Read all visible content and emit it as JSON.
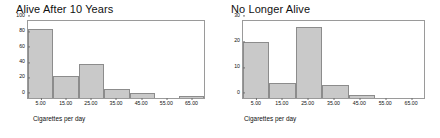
{
  "chart_data": [
    {
      "type": "bar",
      "title": "Alive After 10 Years",
      "xlabel": "Cigarettes per day",
      "ylabel": "",
      "categories": [
        "5.00",
        "15.00",
        "25.00",
        "35.00",
        "45.00",
        "55.00",
        "65.00"
      ],
      "values": [
        90,
        28,
        44,
        12,
        7,
        0,
        2
      ],
      "xlim": [
        0,
        70
      ],
      "ylim": [
        0,
        100
      ],
      "yticks": [
        "0",
        "20",
        "40",
        "60",
        "80",
        "100"
      ],
      "ytick_values": [
        0,
        20,
        40,
        60,
        80,
        100
      ],
      "xticks": [
        "5.00",
        "15.00",
        "25.00",
        "35.00",
        "45.00",
        "55.00",
        "65.00"
      ],
      "grid": false,
      "legend": "none",
      "bar_fill": "#c9c9c9",
      "bar_edge": "#8c8c8c"
    },
    {
      "type": "bar",
      "title": "No Longer Alive",
      "xlabel": "Cigarettes per day",
      "ylabel": "",
      "categories": [
        "5.00",
        "15.00",
        "25.00",
        "35.00",
        "45.00",
        "55.00",
        "65.00"
      ],
      "values": [
        22,
        6,
        27.5,
        5,
        1,
        0,
        0
      ],
      "xlim": [
        0,
        70
      ],
      "ylim": [
        0,
        30
      ],
      "yticks": [
        "0",
        "10",
        "20",
        "30"
      ],
      "ytick_values": [
        0,
        10,
        20,
        30
      ],
      "xticks": [
        "5.00",
        "15.00",
        "25.00",
        "35.00",
        "45.00",
        "55.00",
        "65.00"
      ],
      "grid": false,
      "legend": "none",
      "bar_fill": "#c9c9c9",
      "bar_edge": "#8c8c8c"
    }
  ],
  "figure": {
    "background": "#ffffff",
    "panels": 2
  }
}
